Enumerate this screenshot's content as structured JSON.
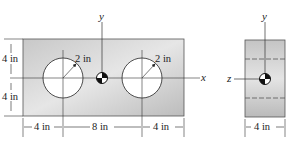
{
  "figure": {
    "front_view": {
      "hole_radius_label": "2 in",
      "hole_radius_label_2": "2 in",
      "height_top_label": "4 in",
      "height_bottom_label": "4 in",
      "width_left_label": "4 in",
      "width_middle_label": "8 in",
      "width_right_label": "4 in",
      "x_axis_label": "x",
      "y_axis_label": "y"
    },
    "side_view": {
      "width_label": "4 in",
      "y_axis_label": "y",
      "z_axis_label": "z"
    },
    "colors": {
      "plate_fill_light": "#e4e4e4",
      "plate_fill_dark": "#b4b4b4",
      "line": "#222222",
      "hole": "#ffffff"
    }
  }
}
